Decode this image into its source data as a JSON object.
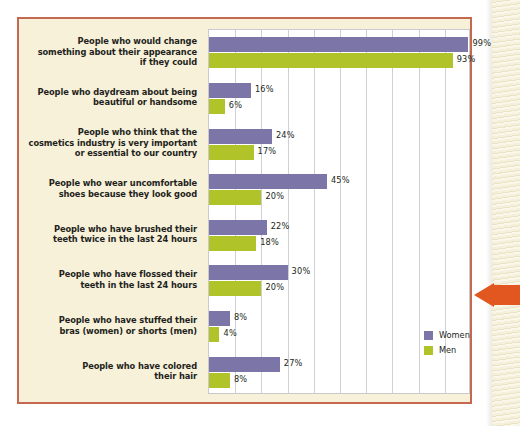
{
  "chart_data": {
    "type": "bar",
    "orientation": "horizontal",
    "grouped": true,
    "title": "",
    "subtitle": "",
    "xlabel": "",
    "ylabel": "",
    "xlim": [
      0,
      100
    ],
    "grid": true,
    "gridline_count": 10,
    "value_suffix": "%",
    "legend_position": "inside-bottom-right",
    "categories": [
      "People who would change something about their appearance if they could",
      "People who daydream about being beautiful or handsome",
      "People who think that the cosmetics industry is very important or essential to our country",
      "People who wear uncomfortable shoes because they look good",
      "People who have brushed their teeth twice in the last 24 hours",
      "People who have flossed their teeth in the last 24 hours",
      "People who have stuffed their bras (women) or shorts (men)",
      "People who have colored their hair"
    ],
    "category_lines": [
      [
        "People who would change",
        "something about their appearance",
        "if they could"
      ],
      [
        "People who daydream about being",
        "beautiful or handsome"
      ],
      [
        "People who think that the",
        "cosmetics industry is very important",
        "or essential to our country"
      ],
      [
        "People who wear uncomfortable",
        "shoes because they look good"
      ],
      [
        "People who have brushed their",
        "teeth twice in the last 24 hours"
      ],
      [
        "People who have flossed their",
        "teeth in the last 24 hours"
      ],
      [
        "People who have stuffed their",
        "bras (women) or shorts (men)"
      ],
      [
        "People who have colored",
        "their hair"
      ]
    ],
    "series": [
      {
        "name": "Women",
        "color": "#7b75a8",
        "values": [
          99,
          16,
          24,
          45,
          22,
          30,
          8,
          27
        ],
        "labels": [
          "99%",
          "16%",
          "24%",
          "45%",
          "22%",
          "30%",
          "8%",
          "27%"
        ]
      },
      {
        "name": "Men",
        "color": "#b0c42a",
        "values": [
          93,
          6,
          17,
          20,
          18,
          20,
          4,
          8
        ],
        "labels": [
          "93%",
          "6%",
          "17%",
          "20%",
          "18%",
          "20%",
          "4%",
          "8%"
        ]
      }
    ]
  },
  "legend": {
    "items": [
      {
        "label": "Women",
        "color": "#7b75a8"
      },
      {
        "label": "Men",
        "color": "#b0c42a"
      }
    ]
  },
  "theme": {
    "panel_background": "#f7f1da",
    "panel_border": "#c4694f",
    "plot_background": "#ffffff",
    "gridline_color": "#cfcfd6",
    "text_color": "#231f20",
    "arrow_color": "#e2571f"
  }
}
